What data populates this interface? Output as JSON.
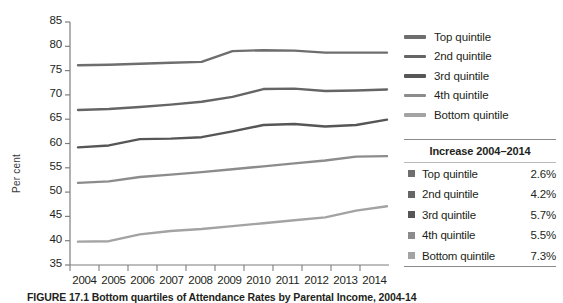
{
  "chart_data": {
    "type": "line",
    "title": "",
    "xlabel": "",
    "ylabel": "Per cent",
    "x": [
      2004,
      2005,
      2006,
      2007,
      2008,
      2009,
      2010,
      2011,
      2012,
      2013,
      2014
    ],
    "xtick_labels": [
      "2004",
      "2005",
      "2006",
      "2007",
      "2008",
      "2009",
      "2010",
      "2011",
      "2012",
      "2013",
      "2014"
    ],
    "ytick_labels": [
      "85",
      "80",
      "75",
      "70",
      "65",
      "60",
      "55",
      "50",
      "45",
      "40",
      "35"
    ],
    "yticks": [
      85,
      80,
      75,
      70,
      65,
      60,
      55,
      50,
      45,
      40,
      35
    ],
    "ylim": [
      35,
      85
    ],
    "xlim": [
      2004,
      2014
    ],
    "grid": false,
    "legend_position": "right",
    "series": [
      {
        "name": "Top quintile",
        "color": "#6e6e6e",
        "values": [
          76.1,
          76.2,
          76.4,
          76.6,
          76.8,
          79.0,
          79.2,
          79.1,
          78.7,
          78.7,
          78.7
        ]
      },
      {
        "name": "2nd quintile",
        "color": "#656565",
        "values": [
          66.9,
          67.1,
          67.5,
          68.0,
          68.6,
          69.6,
          71.2,
          71.3,
          70.8,
          70.9,
          71.1
        ]
      },
      {
        "name": "3rd quintile",
        "color": "#565656",
        "values": [
          59.2,
          59.6,
          60.9,
          61.0,
          61.3,
          62.5,
          63.8,
          64.0,
          63.5,
          63.8,
          64.9
        ]
      },
      {
        "name": "4th quintile",
        "color": "#8c8c8c",
        "values": [
          51.9,
          52.2,
          53.1,
          53.6,
          54.1,
          54.7,
          55.3,
          55.9,
          56.5,
          57.3,
          57.4
        ]
      },
      {
        "name": "Bottom quintile",
        "color": "#a3a3a3",
        "values": [
          39.8,
          39.9,
          41.3,
          42.0,
          42.4,
          43.0,
          43.6,
          44.2,
          44.8,
          46.2,
          47.1
        ]
      }
    ]
  },
  "legend": {
    "items": [
      {
        "label": "Top quintile",
        "color": "#6e6e6e"
      },
      {
        "label": "2nd quintile",
        "color": "#656565"
      },
      {
        "label": "3rd quintile",
        "color": "#565656"
      },
      {
        "label": "4th quintile",
        "color": "#8c8c8c"
      },
      {
        "label": "Bottom quintile",
        "color": "#a3a3a3"
      }
    ]
  },
  "increase_table": {
    "title": "Increase 2004–2014",
    "rows": [
      {
        "label": "Top quintile",
        "value": "2.6%",
        "color": "#6e6e6e"
      },
      {
        "label": "2nd quintile",
        "value": "4.2%",
        "color": "#656565"
      },
      {
        "label": "3rd quintile",
        "value": "5.7%",
        "color": "#565656"
      },
      {
        "label": "4th quintile",
        "value": "5.5%",
        "color": "#8c8c8c"
      },
      {
        "label": "Bottom quintile",
        "value": "7.3%",
        "color": "#a3a3a3"
      }
    ]
  },
  "caption": {
    "text": "FIGURE 17.1  Bottom quartiles of Attendance Rates by Parental Income, 2004-14"
  },
  "colors": {
    "axis": "#7d7d7d",
    "text": "#231f20",
    "background": "#ffffff"
  }
}
